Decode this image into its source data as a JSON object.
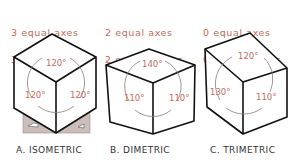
{
  "colors": {
    "line": "#111111",
    "accent": "#c46a5a",
    "arc": "#8a7a78",
    "base_plate": "#cbbdb9",
    "label": "#333333"
  },
  "panels": [
    {
      "id": "isometric",
      "header_line1": "3 equal axes",
      "header_line2": "3 equal angles",
      "angles": {
        "top": "120°",
        "left": "120°",
        "right": "120°"
      },
      "label": "A. ISOMETRIC"
    },
    {
      "id": "dimetric",
      "header_line1": "2 equal axes",
      "header_line2": "2 equal angles",
      "angles": {
        "top": "140°",
        "left": "110°",
        "right": "110°"
      },
      "label": "B. DIMETRIC"
    },
    {
      "id": "trimetric",
      "header_line1": "0 equal axes",
      "header_line2": "0 equal angles",
      "angles": {
        "top": "120°",
        "left": "130°",
        "right": "110°"
      },
      "label": "C. TRIMETRIC"
    }
  ]
}
